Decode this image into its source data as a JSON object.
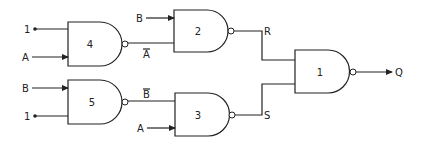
{
  "diagram": {
    "gates": [
      {
        "id": "gate-4",
        "label": "4",
        "type": "NAND"
      },
      {
        "id": "gate-2",
        "label": "2",
        "type": "NAND"
      },
      {
        "id": "gate-5",
        "label": "5",
        "type": "NAND"
      },
      {
        "id": "gate-3",
        "label": "3",
        "type": "NAND"
      },
      {
        "id": "gate-1",
        "label": "1",
        "type": "NAND"
      }
    ],
    "inputs": {
      "g4_top": "1",
      "g4_bottom": "A",
      "g2_top": "B",
      "g5_top": "B",
      "g5_bottom": "1",
      "g3_bottom": "A"
    },
    "signals": {
      "a_bar": "A",
      "b_bar": "B",
      "r": "R",
      "s": "S",
      "q": "Q"
    },
    "colors": {
      "stroke": "#222222",
      "background": "#ffffff"
    }
  }
}
